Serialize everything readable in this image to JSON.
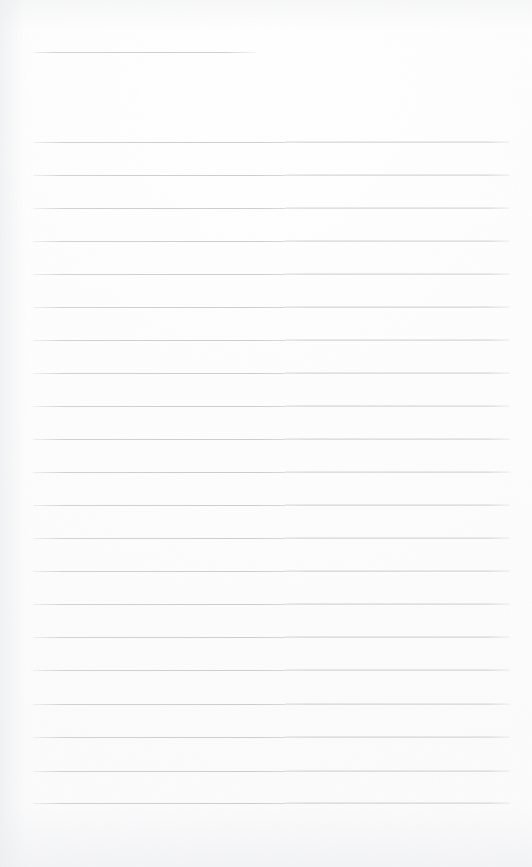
{
  "document": {
    "type": "blank-ruled-page-scan",
    "page_width": 532,
    "page_height": 867,
    "background_color": "#fdfdfd",
    "rule_color": "#d9dbdd",
    "has_text": false,
    "text_content": "",
    "title": "",
    "notes": ""
  },
  "layout": {
    "left_margin": 33,
    "right_margin": 22,
    "content_left": 33,
    "content_right": 510,
    "content_width": 477,
    "first_rule_y": 142,
    "last_rule_y": 803,
    "rule_spacing": 33.05,
    "rule_thickness": 1,
    "seam_x": 285,
    "bottom_blank_height": 60
  },
  "header_rule": {
    "label": "header-underline",
    "y": 52,
    "x_start": 33,
    "x_end": 256,
    "width": 223
  },
  "rules": [
    {
      "index": 1,
      "y": 142,
      "x_start": 33,
      "x_end": 510
    },
    {
      "index": 2,
      "y": 175,
      "x_start": 33,
      "x_end": 510
    },
    {
      "index": 3,
      "y": 208,
      "x_start": 33,
      "x_end": 510
    },
    {
      "index": 4,
      "y": 241,
      "x_start": 33,
      "x_end": 510
    },
    {
      "index": 5,
      "y": 274,
      "x_start": 33,
      "x_end": 510
    },
    {
      "index": 6,
      "y": 307,
      "x_start": 33,
      "x_end": 510
    },
    {
      "index": 7,
      "y": 340,
      "x_start": 33,
      "x_end": 510
    },
    {
      "index": 8,
      "y": 373,
      "x_start": 33,
      "x_end": 510
    },
    {
      "index": 9,
      "y": 406,
      "x_start": 33,
      "x_end": 510
    },
    {
      "index": 10,
      "y": 439,
      "x_start": 33,
      "x_end": 510
    },
    {
      "index": 11,
      "y": 472,
      "x_start": 33,
      "x_end": 510
    },
    {
      "index": 12,
      "y": 505,
      "x_start": 33,
      "x_end": 510
    },
    {
      "index": 13,
      "y": 538,
      "x_start": 33,
      "x_end": 510
    },
    {
      "index": 14,
      "y": 571,
      "x_start": 33,
      "x_end": 510
    },
    {
      "index": 15,
      "y": 604,
      "x_start": 33,
      "x_end": 510
    },
    {
      "index": 16,
      "y": 637,
      "x_start": 33,
      "x_end": 510
    },
    {
      "index": 17,
      "y": 670,
      "x_start": 33,
      "x_end": 510
    },
    {
      "index": 18,
      "y": 704,
      "x_start": 33,
      "x_end": 510
    },
    {
      "index": 19,
      "y": 737,
      "x_start": 33,
      "x_end": 510
    },
    {
      "index": 20,
      "y": 771,
      "x_start": 33,
      "x_end": 510
    },
    {
      "index": 21,
      "y": 803,
      "x_start": 33,
      "x_end": 510
    }
  ]
}
